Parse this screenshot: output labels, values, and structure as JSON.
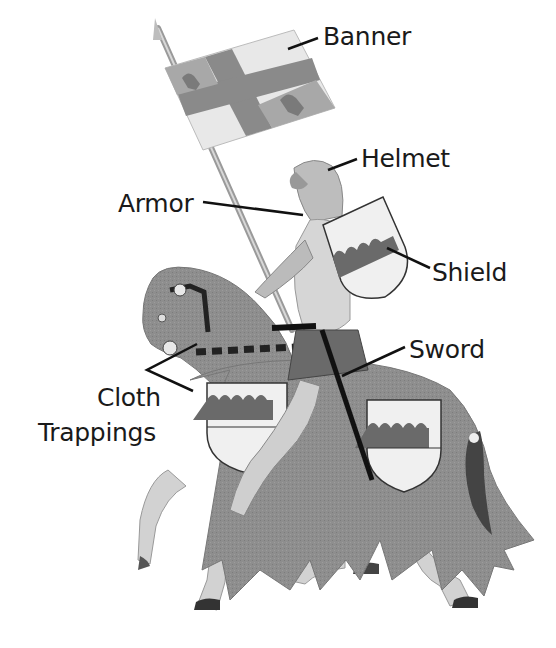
{
  "diagram": {
    "colors": {
      "background": "#ffffff",
      "cloth": "#8e8e8e",
      "cloth_dark": "#6e6e6e",
      "shield_field": "#f0f0f0",
      "shield_charge": "#6a6a6a",
      "armor": "#c9c9c9",
      "leader_line": "#111111",
      "label_text": "#1a1a1a"
    },
    "labels": [
      {
        "id": "banner",
        "text": "Banner"
      },
      {
        "id": "helmet",
        "text": "Helmet"
      },
      {
        "id": "armor",
        "text": "Armor"
      },
      {
        "id": "shield",
        "text": "Shield"
      },
      {
        "id": "sword",
        "text": "Sword"
      },
      {
        "id": "cloth_trappings_line1",
        "text": "Cloth"
      },
      {
        "id": "cloth_trappings_line2",
        "text": "Trappings"
      }
    ]
  }
}
